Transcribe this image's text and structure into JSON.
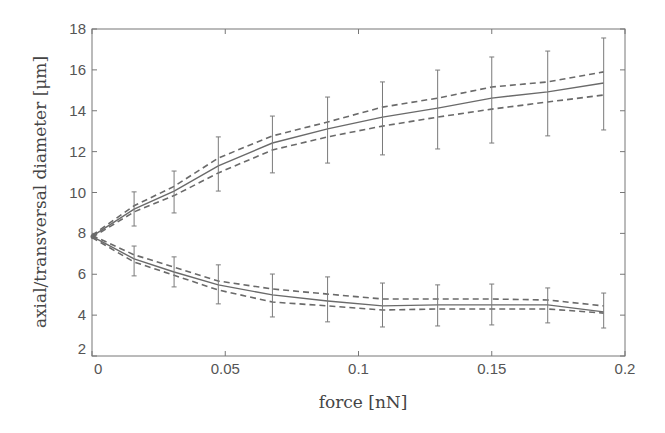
{
  "chart_data": {
    "type": "line",
    "title": "",
    "xlabel": "force [nN]",
    "ylabel": "axial/transversal diameter [μm]",
    "xlim": [
      0,
      0.2
    ],
    "ylim": [
      2,
      18
    ],
    "grid": false,
    "legend": null,
    "x_ticks": [
      0,
      0.05,
      0.1,
      0.15,
      0.2
    ],
    "x_tick_labels": [
      "0",
      "0.05",
      "0.1",
      "0.15",
      "0.2"
    ],
    "y_ticks": [
      2,
      4,
      6,
      8,
      10,
      12,
      14,
      16,
      18
    ],
    "y_tick_labels": [
      "2",
      "4",
      "6",
      "8",
      "10",
      "12",
      "14",
      "16",
      "18"
    ],
    "x": [
      0,
      0.0158,
      0.0308,
      0.0474,
      0.0677,
      0.0884,
      0.109,
      0.1297,
      0.15,
      0.171,
      0.192
    ],
    "series": [
      {
        "name": "axial diameter (mean)",
        "style": "solid",
        "values": [
          7.85,
          9.19,
          10.07,
          11.3,
          12.42,
          13.11,
          13.69,
          14.13,
          14.62,
          14.92,
          15.36
        ],
        "error_upper": [
          null,
          10.03,
          11.05,
          12.72,
          13.74,
          14.67,
          15.41,
          15.99,
          16.63,
          16.92,
          17.56
        ],
        "error_lower": [
          null,
          8.36,
          9.0,
          10.07,
          10.96,
          11.44,
          11.84,
          12.13,
          12.42,
          12.77,
          13.06
        ]
      },
      {
        "name": "axial diameter (upper bound)",
        "style": "dashed",
        "values": [
          7.9,
          9.35,
          10.3,
          11.69,
          12.77,
          13.45,
          14.18,
          14.62,
          15.16,
          15.41,
          15.9
        ]
      },
      {
        "name": "axial diameter (lower bound)",
        "style": "dashed",
        "values": [
          7.8,
          9.05,
          9.85,
          10.96,
          12.08,
          12.72,
          13.25,
          13.69,
          14.08,
          14.43,
          14.77
        ]
      },
      {
        "name": "transversal diameter (mean)",
        "style": "solid",
        "values": [
          7.85,
          6.75,
          6.11,
          5.48,
          4.99,
          4.69,
          4.45,
          4.5,
          4.5,
          4.5,
          4.16
        ],
        "error_upper": [
          null,
          7.38,
          6.85,
          6.46,
          6.01,
          5.87,
          5.57,
          5.48,
          5.52,
          5.33,
          5.08
        ],
        "error_lower": [
          null,
          5.92,
          5.38,
          4.55,
          3.91,
          3.67,
          3.42,
          3.47,
          3.52,
          3.62,
          3.37
        ]
      },
      {
        "name": "transversal diameter (upper bound)",
        "style": "dashed",
        "values": [
          7.9,
          6.95,
          6.35,
          5.67,
          5.28,
          5.03,
          4.79,
          4.79,
          4.79,
          4.74,
          4.45
        ]
      },
      {
        "name": "transversal diameter (lower bound)",
        "style": "dashed",
        "values": [
          7.8,
          6.6,
          5.95,
          5.23,
          4.64,
          4.45,
          4.25,
          4.3,
          4.3,
          4.3,
          4.1
        ]
      }
    ],
    "colors": {
      "mean_line": "#6a6a6a",
      "bound_line": "#6a6a6a",
      "error_bar": "#7a7a7a",
      "axis": "#777777"
    }
  }
}
